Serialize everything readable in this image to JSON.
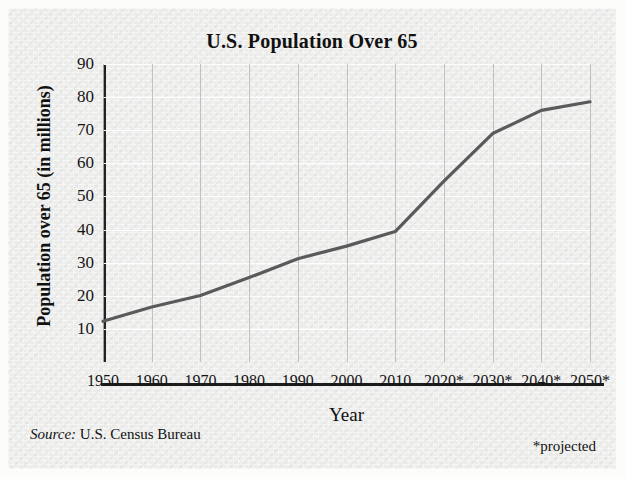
{
  "title": "U.S. Population Over 65",
  "source": {
    "label": "Source:",
    "text": "U.S. Census Bureau"
  },
  "footnote": "*projected",
  "colors": {
    "line": "#5a5a5a",
    "axis": "#1c1c1c",
    "plot_background": "#ececeb",
    "hgrid": "#ffffff",
    "vgrid": "#b9b9b7",
    "text": "#111111"
  },
  "chart_data": {
    "type": "line",
    "title": "U.S. Population Over 65",
    "xlabel": "Year",
    "ylabel": "Population over 65 (in millions)",
    "categories": [
      "1950",
      "1960",
      "1970",
      "1980",
      "1990",
      "2000",
      "2010",
      "2020*",
      "2030*",
      "2040*",
      "2050*"
    ],
    "x": [
      1950,
      1960,
      1970,
      1980,
      1990,
      2000,
      2010,
      2020,
      2030,
      2040,
      2050
    ],
    "values": [
      12.3,
      16.6,
      20.1,
      25.5,
      31.2,
      35.0,
      39.4,
      54.6,
      69.0,
      76.0,
      78.6
    ],
    "ytick_labels": [
      "10",
      "20",
      "30",
      "40",
      "50",
      "60",
      "70",
      "80",
      "90"
    ],
    "yticks": [
      10,
      20,
      30,
      40,
      50,
      60,
      70,
      80,
      90
    ],
    "ylim": [
      0,
      90
    ],
    "xlim": [
      1950,
      2050
    ],
    "grid": true,
    "legend": false,
    "annotations": [
      "*projected"
    ]
  }
}
